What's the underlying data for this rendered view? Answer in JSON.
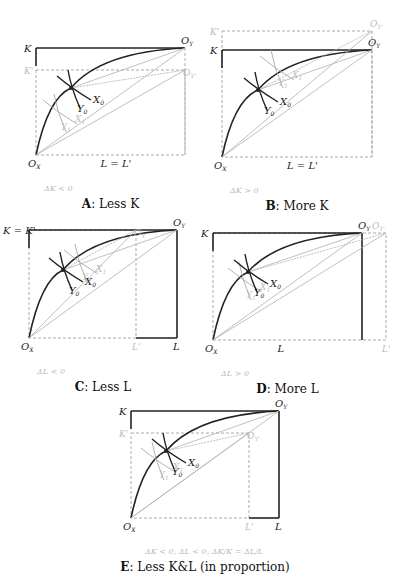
{
  "colors": {
    "box": "#222222",
    "curve": "#222222",
    "faint_line": "#b0b0b0",
    "dashed": "#aaaaaa",
    "isoquant0": "#222222",
    "isoquant1": "#a8a8a8",
    "faint_text": "#bbbbbb"
  },
  "panels": [
    {
      "id": "A",
      "caption_letter": "A",
      "caption_text": ": Less K",
      "delta_text": "ΔK < 0",
      "box": [
        36,
        48,
        185,
        155
      ],
      "new_box": [
        36,
        70,
        185,
        155
      ],
      "new_box_dashed": "top_and_right_and_bottom",
      "labels": {
        "K": "K",
        "K_prime": "K'",
        "Ox": "O",
        "Ox_sub": "X",
        "Oy": "O",
        "Oy_sub": "Y",
        "Oy_prime": "O",
        "Oy_prime_sub": "Y'",
        "L": "L = L'",
        "X0": "X",
        "X0_sub": "0",
        "Y0": "Y",
        "Y0_sub": "0",
        "X1": "X",
        "X1_sub": "1",
        "Y1": "Y",
        "Y1_sub": "1"
      },
      "tangency0": [
        71,
        88
      ],
      "tangency1": [
        57,
        112
      ],
      "shift": "down"
    },
    {
      "id": "B",
      "caption_letter": "B",
      "caption_text": ": More K",
      "delta_text": "ΔK > 0",
      "box": [
        222,
        50,
        372,
        157
      ],
      "new_box": [
        222,
        31,
        372,
        157
      ],
      "labels": {
        "K": "K",
        "K_prime": "K'",
        "Ox": "O",
        "Ox_sub": "X",
        "Oy": "O",
        "Oy_sub": "Y",
        "Oy_prime": "O",
        "Oy_prime_sub": "Y'",
        "L": "L = L'",
        "X0": "X",
        "X0_sub": "0",
        "Y0": "Y",
        "Y0_sub": "0",
        "X1": "X",
        "X1_sub": "1",
        "Y1": "Y",
        "Y1_sub": "1"
      },
      "tangency0": [
        258,
        90
      ],
      "tangency1": [
        274,
        68
      ],
      "shift": "up"
    },
    {
      "id": "C",
      "caption_letter": "C",
      "caption_text": ": Less L",
      "delta_text": "ΔL < 0",
      "box": [
        29,
        230,
        177,
        338
      ],
      "new_box": [
        29,
        230,
        136,
        338
      ],
      "labels": {
        "K": "K = K'",
        "Ox": "O",
        "Ox_sub": "X",
        "Oy": "O",
        "Oy_sub": "Y",
        "Oy_prime": "O",
        "Oy_prime_sub": "Y'",
        "L": "L",
        "L_prime": "L'",
        "X0": "X",
        "X0_sub": "0",
        "Y0": "Y",
        "Y0_sub": "0",
        "X1": "X",
        "X1_sub": "1",
        "Y1": "Y",
        "Y1_sub": "1"
      },
      "tangency0": [
        63,
        270
      ],
      "tangency1": [
        78,
        262
      ],
      "shift": "left"
    },
    {
      "id": "D",
      "caption_letter": "D",
      "caption_text": ": More L",
      "delta_text": "ΔL > 0",
      "box": [
        213,
        233,
        362,
        340
      ],
      "new_box": [
        213,
        233,
        386,
        340
      ],
      "labels": {
        "K": "K",
        "Ox": "O",
        "Ox_sub": "X",
        "Oy": "O",
        "Oy_sub": "Y",
        "Oy_prime": "O",
        "Oy_prime_sub": "Y'",
        "L": "L",
        "L_prime": "L'",
        "X0": "X",
        "X0_sub": "0",
        "Y0": "Y",
        "Y0_sub": "0",
        "X1": "X",
        "X1_sub": "1",
        "Y1": "Y",
        "Y1_sub": "1"
      },
      "tangency0": [
        248,
        272
      ],
      "tangency1": [
        242,
        280
      ],
      "shift": "right"
    },
    {
      "id": "E",
      "caption_letter": "E",
      "caption_text": ": Less K&L (in proportion)",
      "delta_text": "ΔK < 0, ΔL < 0, ΔK/K = ΔL/L",
      "box": [
        131,
        411,
        279,
        518
      ],
      "new_box": [
        131,
        433,
        249,
        518
      ],
      "labels": {
        "K": "K",
        "K_prime": "K'",
        "Ox": "O",
        "Ox_sub": "X",
        "Oy": "O",
        "Oy_sub": "Y",
        "Oy_prime": "O",
        "Oy_prime_sub": "Y'",
        "L": "L",
        "L_prime": "L'",
        "X0": "X",
        "X0_sub": "0",
        "Y0": "Y",
        "Y0_sub": "0",
        "X1": "X",
        "X1_sub": "1",
        "Y1": "Y",
        "Y1_sub": "1"
      },
      "tangency0": [
        166,
        451
      ],
      "tangency1": [
        155,
        460
      ],
      "shift": "shrink"
    }
  ]
}
